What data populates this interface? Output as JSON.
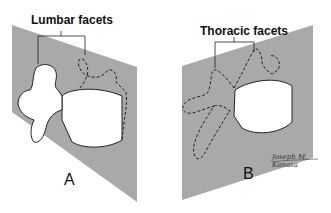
{
  "figure": {
    "panels": [
      {
        "id": "A",
        "letter": "A",
        "label": "Lumbar facets",
        "plane_color": "#a9a9a9",
        "description": "Lumbar vertebra with facet joints oriented in sagittal plane"
      },
      {
        "id": "B",
        "letter": "B",
        "label": "Thoracic facets",
        "plane_color": "#a9a9a9",
        "description": "Thoracic vertebra with facet joints oriented in coronal plane"
      }
    ],
    "signature": "Joseph M. Kanasa"
  }
}
